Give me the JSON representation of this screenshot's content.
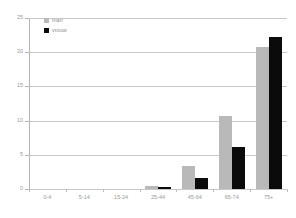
{
  "chart_data": {
    "type": "bar",
    "title": "",
    "subtitle": "",
    "xlabel": "",
    "ylabel": "",
    "categories": [
      "0-4",
      "5-14",
      "15-24",
      "25-44",
      "45-64",
      "65-74",
      "75+"
    ],
    "series": [
      {
        "name": "man",
        "color": "#b9b9b9",
        "values": [
          0,
          0,
          0,
          0.5,
          3.3,
          10.7,
          20.8
        ]
      },
      {
        "name": "vrouw",
        "color": "#0b0b0b",
        "values": [
          0,
          0,
          0,
          0.3,
          1.6,
          6.2,
          22.2
        ]
      }
    ],
    "ylim": [
      0,
      25
    ],
    "yticks": [
      0,
      5,
      10,
      15,
      20,
      25
    ],
    "ytick_labels": [
      "0",
      "5",
      "10",
      "15",
      "20",
      "25"
    ],
    "grid": true,
    "grid_axis": "y",
    "legend_position": "upper-left",
    "legend": [
      {
        "label": "man",
        "marker": "square",
        "color": "#b9b9b9"
      },
      {
        "label": "vrouw",
        "marker": "square",
        "color": "#0b0b0b"
      }
    ],
    "axis_color": "#b4b4b4",
    "gridline_color": "#c8c8c8",
    "tick_label_color": "#9a9a9a",
    "background": "#ffffff"
  }
}
